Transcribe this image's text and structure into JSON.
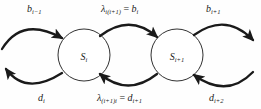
{
  "diagram": {
    "type": "state-transition-diagram",
    "title": "",
    "background_color": "#fefefe",
    "stroke_color": "#1a1a1a",
    "text_color": "#1a1a1a",
    "states": [
      {
        "id": "state-i",
        "label_base": "S",
        "label_sub": "i",
        "cx": 84,
        "cy": 55,
        "r": 26
      },
      {
        "id": "state-i-plus-1",
        "label_base": "S",
        "label_sub": "i+1",
        "cx": 177,
        "cy": 55,
        "r": 26
      }
    ],
    "transitions": [
      {
        "id": "birth-in-left",
        "direction": "rightward",
        "position": "top-left",
        "label_base": "b",
        "label_sub": "i−1",
        "full_label": "b_{i-1}"
      },
      {
        "id": "birth-middle",
        "direction": "rightward",
        "position": "top-middle",
        "label_lambda": "λ",
        "label_lambda_sub": "i(i+1)",
        "label_eq": " = ",
        "label_base": "b",
        "label_sub": "i",
        "full_label": "λ_{i(i+1)} = b_i"
      },
      {
        "id": "birth-out-right",
        "direction": "rightward",
        "position": "top-right",
        "label_base": "b",
        "label_sub": "i+1",
        "full_label": "b_{i+1}"
      },
      {
        "id": "death-out-left",
        "direction": "leftward",
        "position": "bottom-left",
        "label_base": "d",
        "label_sub": "i",
        "full_label": "d_i"
      },
      {
        "id": "death-middle",
        "direction": "leftward",
        "position": "bottom-middle",
        "label_lambda": "λ",
        "label_lambda_sub": "(i+1)i",
        "label_eq": " = ",
        "label_base": "d",
        "label_sub": "i+1",
        "full_label": "λ_{(i+1)i} = d_{i+1}"
      },
      {
        "id": "death-in-right",
        "direction": "leftward",
        "position": "bottom-right",
        "label_base": "d",
        "label_sub": "i+2",
        "full_label": "d_{i+2}"
      }
    ]
  }
}
